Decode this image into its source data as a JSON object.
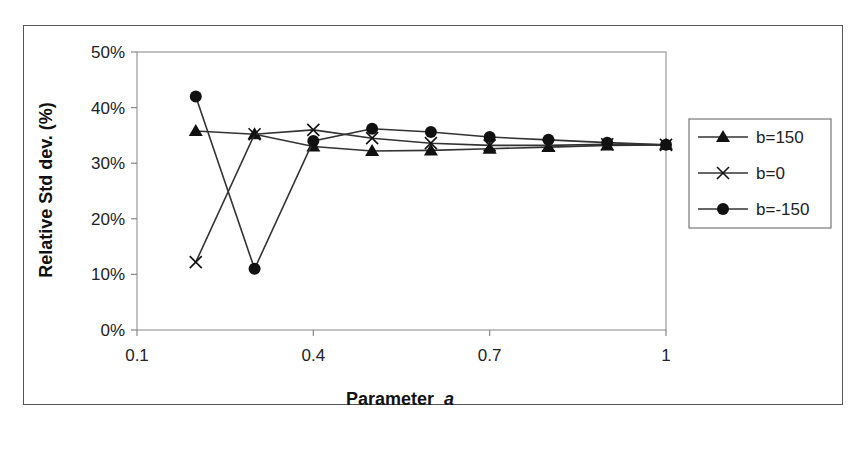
{
  "chart_data": {
    "type": "line",
    "title": "",
    "xlabel": "Parameter",
    "xlabel_italic": "a",
    "ylabel": "Relative Std dev. (%)",
    "xlim": [
      0.1,
      1.0
    ],
    "ylim": [
      0,
      50
    ],
    "x_ticks": [
      0.1,
      0.4,
      0.7,
      1.0
    ],
    "x_tick_labels": [
      "0.1",
      "0.4",
      "0.7",
      "1"
    ],
    "y_ticks": [
      0,
      10,
      20,
      30,
      40,
      50
    ],
    "y_tick_labels": [
      "0%",
      "10%",
      "20%",
      "30%",
      "40%",
      "50%"
    ],
    "grid": false,
    "legend_position": "right",
    "x": [
      0.2,
      0.3,
      0.4,
      0.5,
      0.6,
      0.7,
      0.8,
      0.9,
      1.0
    ],
    "series": [
      {
        "name": "b=150",
        "marker": "triangle",
        "values": [
          35.8,
          35.2,
          33.0,
          32.2,
          32.3,
          32.6,
          32.9,
          33.2,
          33.3
        ]
      },
      {
        "name": "b=0",
        "marker": "x",
        "values": [
          12.2,
          35.2,
          36.0,
          34.5,
          33.6,
          33.2,
          33.2,
          33.4,
          33.3
        ]
      },
      {
        "name": "b=-150",
        "marker": "circle",
        "values": [
          42.0,
          11.0,
          34.0,
          36.2,
          35.6,
          34.7,
          34.2,
          33.7,
          33.3
        ]
      }
    ]
  },
  "colors": {
    "line": "#333333",
    "marker": "#111111",
    "axis": "#888888",
    "frame": "#555555"
  }
}
